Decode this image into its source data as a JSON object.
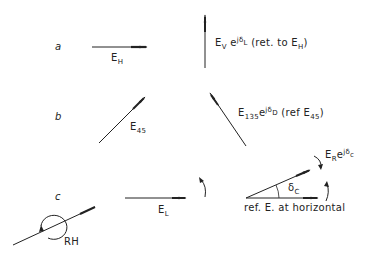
{
  "rows": [
    {
      "id": "a",
      "label": "a",
      "left_vector": {
        "base": "E",
        "sub": "H"
      },
      "right_vector": {
        "base": "E",
        "sub": "V",
        "exp_base": "e",
        "exp": "jδ",
        "exp_sub": "L",
        "note_open": "(ret. to E",
        "note_sub": "H",
        "note_close": ")"
      }
    },
    {
      "id": "b",
      "label": "b",
      "left_vector": {
        "base": "E",
        "sub": "45"
      },
      "right_vector": {
        "base": "E",
        "sub": "135",
        "exp_base": "e",
        "exp": "jδ",
        "exp_sub": "D",
        "note_open": "(ref E",
        "note_sub": "45",
        "note_close": ")"
      }
    },
    {
      "id": "c",
      "label": "c",
      "circular_label": "RH",
      "left_vector": {
        "base": "E",
        "sub": "L"
      },
      "right_vector": {
        "base": "E",
        "sub": "R",
        "exp_base": "e",
        "exp": "jδ",
        "exp_sub": "c"
      },
      "angle_label": {
        "base": "δ",
        "sub": "C"
      },
      "reference_caption": "ref. E. at horizontal"
    }
  ],
  "colors": {
    "ink": "#222222",
    "background": "#ffffff"
  }
}
